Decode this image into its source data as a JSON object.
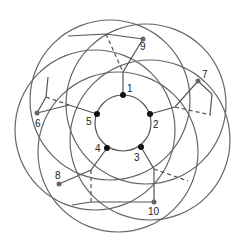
{
  "diagram": {
    "colors": {
      "line": "#555555",
      "node_inner": "#111111",
      "node_outer": "#666666"
    },
    "inner_circle": {
      "cx": 123,
      "cy": 123,
      "r": 28
    },
    "outer_circles": [
      {
        "cx": 110,
        "cy": 100,
        "r": 80
      },
      {
        "cx": 146,
        "cy": 104,
        "r": 80
      },
      {
        "cx": 150,
        "cy": 140,
        "r": 80
      },
      {
        "cx": 118,
        "cy": 152,
        "r": 80
      },
      {
        "cx": 95,
        "cy": 130,
        "r": 80
      }
    ],
    "nodes": [
      {
        "id": "1",
        "label": "1",
        "x": 123,
        "y": 95,
        "kind": "inner",
        "lx": 127,
        "ly": 92
      },
      {
        "id": "2",
        "label": "2",
        "x": 150,
        "y": 114,
        "kind": "inner",
        "lx": 153,
        "ly": 128
      },
      {
        "id": "3",
        "label": "3",
        "x": 141,
        "y": 147,
        "kind": "inner",
        "lx": 134,
        "ly": 161
      },
      {
        "id": "4",
        "label": "4",
        "x": 107,
        "y": 148,
        "kind": "inner",
        "lx": 95,
        "ly": 152
      },
      {
        "id": "5",
        "label": "5",
        "x": 97,
        "y": 114,
        "kind": "inner",
        "lx": 86,
        "ly": 125
      },
      {
        "id": "6",
        "label": "6",
        "x": 37,
        "y": 113,
        "kind": "outer",
        "lx": 35,
        "ly": 127
      },
      {
        "id": "7",
        "label": "7",
        "x": 198,
        "y": 81,
        "kind": "outer",
        "lx": 202,
        "ly": 78
      },
      {
        "id": "8",
        "label": "8",
        "x": 59,
        "y": 184,
        "kind": "outer",
        "lx": 55,
        "ly": 179
      },
      {
        "id": "9",
        "label": "9",
        "x": 143,
        "y": 39,
        "kind": "outer",
        "lx": 140,
        "ly": 50
      },
      {
        "id": "10",
        "label": "10",
        "x": 154,
        "y": 202,
        "kind": "outer",
        "lx": 148,
        "ly": 215
      }
    ],
    "edges": [
      {
        "from": "1",
        "to": "9p",
        "style": "solid"
      },
      {
        "from": "2",
        "to": "7",
        "style": "solid"
      },
      {
        "from": "3",
        "to": "10",
        "style": "solid"
      },
      {
        "from": "4",
        "to": "8",
        "style": "solid"
      },
      {
        "from": "5",
        "to": "6",
        "style": "solid"
      }
    ]
  }
}
